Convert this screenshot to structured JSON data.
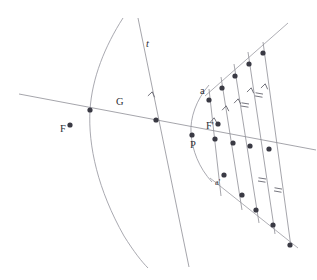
{
  "figure": {
    "background_color": "#ffffff",
    "line_color": "#9a9aa2",
    "dot_color": "#3a3a44",
    "label_color": "#2e2e36"
  },
  "labels": {
    "focus_left": "F",
    "vertex_left": "G",
    "tangent_line": "t",
    "point_a": "a",
    "focus_right": "F'",
    "point_p": "P",
    "point_a_prime": "a'"
  },
  "label_positions": {
    "focus_left": {
      "x": 60,
      "y": 132
    },
    "vertex_left": {
      "x": 116,
      "y": 105
    },
    "tangent_line": {
      "x": 146,
      "y": 47
    },
    "point_a": {
      "x": 200,
      "y": 94
    },
    "focus_right": {
      "x": 206,
      "y": 129
    },
    "point_p": {
      "x": 190,
      "y": 148
    },
    "point_a_prime": {
      "x": 215,
      "y": 185
    }
  },
  "curves": {
    "hyperbola_left_branch": "M 123 18 C 105 46, 92 78, 90 110 C 88 146, 98 190, 124 236 C 134 252, 142 262, 148 268",
    "hyperbola_right_arc": "M 209 85 C 196 100, 190 118, 191 133 C 192 150, 199 168, 212 182"
  },
  "lines": {
    "axis_line": {
      "x1": 19,
      "y1": 94,
      "x2": 316,
      "y2": 150
    },
    "line_t": {
      "x1": 138,
      "y1": 18,
      "x2": 189,
      "y2": 267
    },
    "upper_ray": {
      "x1": 205,
      "y1": 96,
      "x2": 288,
      "y2": 23
    },
    "lower_ray": {
      "x1": 210,
      "y1": 178,
      "x2": 298,
      "y2": 248
    }
  },
  "transversals": [
    {
      "x1": 209,
      "y1": 89,
      "x2": 221,
      "y2": 196
    },
    {
      "x1": 221,
      "y1": 77,
      "x2": 242,
      "y2": 210
    },
    {
      "x1": 234,
      "y1": 64,
      "x2": 259,
      "y2": 223
    },
    {
      "x1": 248,
      "y1": 52,
      "x2": 275,
      "y2": 234
    },
    {
      "x1": 263,
      "y1": 42,
      "x2": 291,
      "y2": 247
    }
  ],
  "dots": {
    "axis_points": [
      {
        "x": 90,
        "y": 110,
        "name": "vertex-g-dot"
      },
      {
        "x": 156,
        "y": 120,
        "name": "axis-intersection-dot"
      },
      {
        "x": 192,
        "y": 135,
        "name": "point-p-dot"
      },
      {
        "x": 215,
        "y": 139,
        "name": "axis-dot-1"
      },
      {
        "x": 233,
        "y": 143,
        "name": "axis-dot-2"
      },
      {
        "x": 250,
        "y": 146,
        "name": "axis-dot-3"
      },
      {
        "x": 269,
        "y": 149,
        "name": "axis-dot-4"
      }
    ],
    "focus_points": [
      {
        "x": 70,
        "y": 125,
        "name": "focus-f-dot"
      },
      {
        "x": 218,
        "y": 124,
        "name": "focus-f-prime-dot"
      }
    ],
    "upper_ray_points": [
      {
        "x": 209,
        "y": 100,
        "name": "point-a-dot"
      },
      {
        "x": 222,
        "y": 88,
        "name": "upper-dot-1"
      },
      {
        "x": 235,
        "y": 76,
        "name": "upper-dot-2"
      },
      {
        "x": 249,
        "y": 64,
        "name": "upper-dot-3"
      },
      {
        "x": 263,
        "y": 53,
        "name": "upper-dot-4"
      }
    ],
    "lower_ray_points": [
      {
        "x": 224,
        "y": 175,
        "name": "point-a-prime-dot"
      },
      {
        "x": 242,
        "y": 195,
        "name": "lower-dot-1"
      },
      {
        "x": 256,
        "y": 210,
        "name": "lower-dot-2"
      },
      {
        "x": 273,
        "y": 225,
        "name": "lower-dot-3"
      },
      {
        "x": 290,
        "y": 245,
        "name": "lower-dot-4"
      }
    ]
  },
  "marks": {
    "arrow_chevrons": [
      {
        "x": 152,
        "y": 93,
        "angle": 12,
        "name": "arrow-mark-line-t"
      },
      {
        "x": 214,
        "y": 119,
        "angle": 6,
        "name": "arrow-mark-1"
      },
      {
        "x": 226,
        "y": 107,
        "angle": 8,
        "name": "arrow-mark-2"
      },
      {
        "x": 238,
        "y": 100,
        "angle": 9,
        "name": "arrow-mark-3"
      },
      {
        "x": 251,
        "y": 89,
        "angle": 10,
        "name": "arrow-mark-4"
      },
      {
        "x": 265,
        "y": 85,
        "angle": 11,
        "name": "arrow-mark-5"
      }
    ],
    "tick_double": [
      {
        "x": 245,
        "y": 105,
        "angle": 9,
        "name": "tick-mark-upper-1"
      },
      {
        "x": 259,
        "y": 95,
        "angle": 10,
        "name": "tick-mark-upper-2"
      },
      {
        "x": 262,
        "y": 180,
        "angle": 9,
        "name": "tick-mark-lower-1"
      },
      {
        "x": 278,
        "y": 190,
        "angle": 10,
        "name": "tick-mark-lower-2"
      }
    ]
  }
}
